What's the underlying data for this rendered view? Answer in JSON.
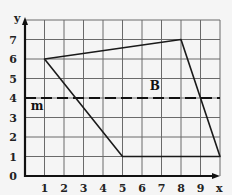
{
  "diagram": {
    "axes": {
      "x_label": "x",
      "y_label": "y",
      "x_range": [
        0,
        10
      ],
      "y_range": [
        0,
        8
      ],
      "x_ticks": [
        "1",
        "2",
        "3",
        "4",
        "5",
        "6",
        "7",
        "8",
        "9"
      ],
      "y_ticks": [
        "0",
        "1",
        "2",
        "3",
        "4",
        "5",
        "6",
        "7"
      ],
      "grid": true
    },
    "polygon": {
      "vertices": [
        [
          1,
          6
        ],
        [
          8,
          7
        ],
        [
          10,
          1
        ],
        [
          5,
          1
        ]
      ]
    },
    "line_m": {
      "label": "m",
      "y": 4,
      "style": "dashed",
      "label_pos": [
        0.3,
        3.6
      ]
    },
    "region_label": {
      "text": "B",
      "pos": [
        6.4,
        4.4
      ]
    },
    "colors": {
      "background": "#f5f5f5",
      "grid": "#6a6a6a",
      "ink": "#111111"
    }
  }
}
